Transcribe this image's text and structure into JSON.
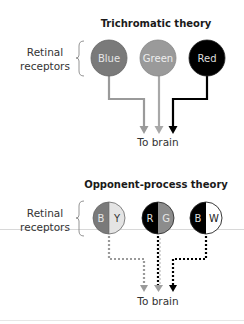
{
  "top_diagram": {
    "title": "Trichromatic theory",
    "side_label_line1": "Retinal",
    "side_label_line2": "receptors",
    "receptors": [
      {
        "label": "Blue",
        "fill": "#7a7a7a",
        "text_color": "#e6e6e6"
      },
      {
        "label": "Green",
        "fill": "#9a9a9a",
        "text_color": "#eeeeee"
      },
      {
        "label": "Red",
        "fill": "#000000",
        "text_color": "#dddddd"
      }
    ],
    "arrow_colors": [
      "#9a9a9a",
      "#a8a8a8",
      "#000000"
    ],
    "destination": "To brain"
  },
  "bottom_diagram": {
    "title": "Opponent-process theory",
    "side_label_line1": "Retinal",
    "side_label_line2": "receptors",
    "receptors": [
      {
        "left_label": "B",
        "right_label": "Y",
        "left_fill": "#7a7a7a",
        "right_fill": "#e4e4e4"
      },
      {
        "left_label": "R",
        "right_label": "G",
        "left_fill": "#000000",
        "right_fill": "#8c8c8c"
      },
      {
        "left_label": "B",
        "right_label": "W",
        "left_fill": "#000000",
        "right_fill": "#ffffff"
      }
    ],
    "arrow_style": "dotted",
    "destination": "To brain"
  }
}
